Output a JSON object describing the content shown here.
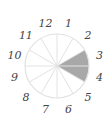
{
  "diagram": {
    "type": "spinner-wheel",
    "sectors": 12,
    "labels": [
      "1",
      "2",
      "3",
      "4",
      "5",
      "6",
      "7",
      "8",
      "9",
      "10",
      "11",
      "12"
    ],
    "shaded_sectors": [
      3,
      4
    ],
    "colors": {
      "shade": "#a8a8a8",
      "line": "#e2e2e2",
      "label": "#444444"
    }
  }
}
